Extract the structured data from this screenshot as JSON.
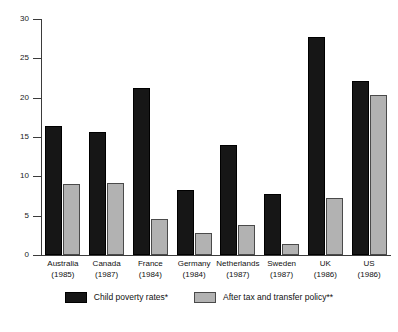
{
  "chart_data": {
    "type": "bar",
    "title": "",
    "subtitle": "",
    "xlabel": "",
    "ylabel": "",
    "ylim": [
      0,
      30
    ],
    "yticks": [
      0,
      5,
      10,
      15,
      20,
      25,
      30
    ],
    "ytick_labels": [
      "0",
      "5",
      "10",
      "15",
      "20",
      "25",
      "30"
    ],
    "grid": false,
    "legend_position": "bottom-center",
    "categories": [
      "Australia",
      "Canada",
      "France",
      "Germany",
      "Netherlands",
      "Sweden",
      "UK",
      "US"
    ],
    "category_years": [
      "(1985)",
      "(1987)",
      "(1984)",
      "(1984)",
      "(1987)",
      "(1987)",
      "(1986)",
      "(1986)"
    ],
    "series": [
      {
        "name": "Child poverty rates*",
        "color": "#161616",
        "values": [
          16.4,
          15.7,
          21.2,
          8.3,
          14.0,
          7.8,
          27.7,
          22.1
        ]
      },
      {
        "name": "After tax and transfer policy**",
        "color": "#b2b2b2",
        "values": [
          9.0,
          9.2,
          4.6,
          2.8,
          3.8,
          1.4,
          7.2,
          20.3
        ]
      }
    ]
  },
  "legend": {
    "items": [
      {
        "label": "Child poverty rates*",
        "swatch": "dark"
      },
      {
        "label": "After tax and transfer policy**",
        "swatch": "light"
      }
    ]
  },
  "colors": {
    "series_dark": "#161616",
    "series_light": "#b2b2b2",
    "axis": "#3b3b3b",
    "text": "#111111",
    "background": "#ffffff"
  }
}
